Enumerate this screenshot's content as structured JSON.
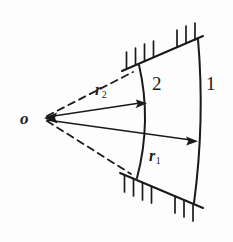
{
  "figure": {
    "background_color": "#fdfdfd",
    "ink_color": "#1a1a1a",
    "width": 233,
    "height": 242,
    "labels": {
      "origin": "o",
      "region_outer": "1",
      "region_inner": "2",
      "radius_outer_symbol": "r",
      "radius_outer_subscript": "1",
      "radius_inner_symbol": "r",
      "radius_inner_subscript": "2"
    },
    "geometry": {
      "origin_point": [
        44,
        118
      ],
      "inner_arc": {
        "start": [
          139,
          65
        ],
        "control": [
          152,
          121
        ],
        "end": [
          137,
          178
        ]
      },
      "outer_arc": {
        "start": [
          198,
          39
        ],
        "control": [
          205,
          121
        ],
        "end": [
          194,
          203
        ]
      },
      "upper_boundary_line": {
        "start": [
          122,
          71
        ],
        "end": [
          203,
          36
        ]
      },
      "lower_boundary_line": {
        "start": [
          120,
          173
        ],
        "end": [
          203,
          208
        ]
      },
      "upper_dashed_line": {
        "start": [
          47,
          116
        ],
        "end": [
          133,
          72
        ]
      },
      "lower_dashed_line": {
        "start": [
          47,
          121
        ],
        "end": [
          131,
          174
        ]
      },
      "arrow_r2": {
        "start": [
          47,
          117
        ],
        "end": [
          146,
          103
        ]
      },
      "arrow_r1": {
        "start": [
          47,
          120
        ],
        "end": [
          197,
          141
        ]
      },
      "hatch_tick_length": 17,
      "hatch_upper_count": 7,
      "hatch_lower_count": 7
    }
  }
}
